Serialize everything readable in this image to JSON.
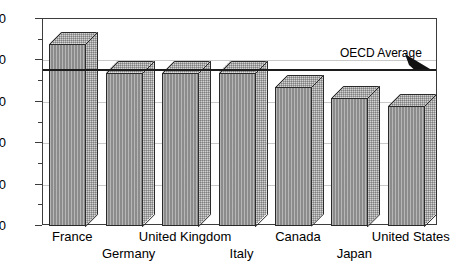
{
  "chart_data": {
    "type": "bar",
    "title": "",
    "subtitle": "",
    "xlabel": "",
    "ylabel": "",
    "categories": [
      "France",
      "Germany",
      "United Kingdom",
      "Italy",
      "Canada",
      "Japan",
      "United States"
    ],
    "values": [
      44,
      37,
      37,
      37,
      33.5,
      31,
      29
    ],
    "ylim": [
      0,
      50
    ],
    "ytick_labels": [
      "0",
      "10",
      "20",
      "30",
      "40",
      "50"
    ],
    "ytick_values": [
      0,
      10,
      20,
      30,
      40,
      50
    ],
    "yminor_values": [
      5,
      15,
      25,
      35,
      45
    ],
    "grid": true,
    "grid_axis": "y",
    "legend_position": "none",
    "style": "3d-bar",
    "annotations": [
      {
        "name": "oecd-average",
        "label": "OECD Average",
        "value": 38,
        "type": "horizontal-line-with-arrow"
      }
    ],
    "colors": {
      "bar_front": "#9b9b9b",
      "bar_top": "#d2d2d2",
      "bar_side": "#d2d2d2",
      "bar_outline": "#2a2a2a",
      "grid": "#c9c9c9",
      "axis": "#3c3c3c",
      "average_line": "#1c1c1c",
      "background": "#ffffff",
      "text": "#000000"
    }
  },
  "axis": {
    "y": {
      "ticks": [
        {
          "label": "50",
          "value": 50
        },
        {
          "label": "40",
          "value": 40
        },
        {
          "label": "30",
          "value": 30
        },
        {
          "label": "20",
          "value": 20
        },
        {
          "label": "10",
          "value": 10
        },
        {
          "label": "0",
          "value": 0
        }
      ]
    },
    "x": {
      "labels": [
        {
          "label": "France",
          "row": 0
        },
        {
          "label": "Germany",
          "row": 1
        },
        {
          "label": "United Kingdom",
          "row": 0
        },
        {
          "label": "Italy",
          "row": 1
        },
        {
          "label": "Canada",
          "row": 0
        },
        {
          "label": "Japan",
          "row": 1
        },
        {
          "label": "United States",
          "row": 0
        }
      ]
    }
  },
  "annotation": {
    "oecd_average_label": "OECD Average"
  }
}
